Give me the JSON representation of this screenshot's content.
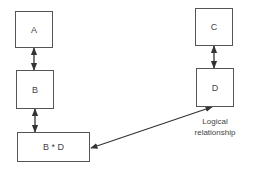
{
  "diagram": {
    "nodes": [
      {
        "id": "A",
        "label": "A"
      },
      {
        "id": "B",
        "label": "B"
      },
      {
        "id": "BD",
        "label": "B * D"
      },
      {
        "id": "C",
        "label": "C"
      },
      {
        "id": "D",
        "label": "D"
      }
    ],
    "edges": [
      {
        "from": "A",
        "to": "B",
        "type": "bidirectional"
      },
      {
        "from": "B",
        "to": "BD",
        "type": "bidirectional"
      },
      {
        "from": "C",
        "to": "D",
        "type": "bidirectional"
      },
      {
        "from": "D",
        "to": "BD",
        "type": "bidirectional",
        "label": "Logical relationship"
      }
    ],
    "annotation": {
      "line1": "Logical",
      "line2": "relationship"
    }
  }
}
